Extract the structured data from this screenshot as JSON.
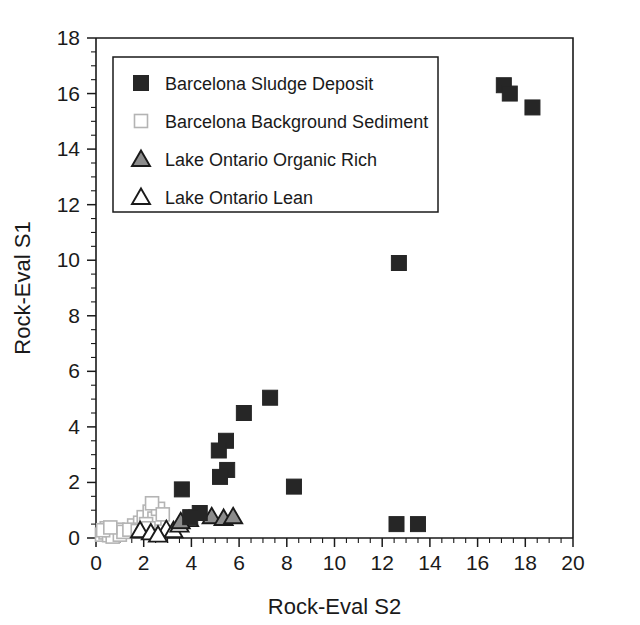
{
  "figure": {
    "background": "#ffffff"
  },
  "chart_data": {
    "type": "scatter",
    "title": "",
    "xlabel": "Rock-Eval S2",
    "ylabel": "Rock-Eval S1",
    "xlim": [
      0,
      20
    ],
    "ylim": [
      0,
      18
    ],
    "xticks": [
      0,
      2,
      4,
      6,
      8,
      10,
      12,
      14,
      16,
      18,
      20
    ],
    "yticks": [
      0,
      2,
      4,
      6,
      8,
      10,
      12,
      14,
      16,
      18
    ],
    "xtick_labels": [
      "0",
      "2",
      "4",
      "6",
      "8",
      "10",
      "12",
      "14",
      "16",
      "18",
      "20"
    ],
    "ytick_labels": [
      "0",
      "2",
      "4",
      "6",
      "8",
      "10",
      "12",
      "14",
      "16",
      "18"
    ],
    "x_minor_step": 0.5,
    "y_minor_step": 0.5,
    "grid": false,
    "legend_position": "upper-left-inside",
    "series": [
      {
        "name": "Barcelona Sludge Deposit",
        "marker": "filled-square",
        "color": "#262626",
        "edge_color": "#262626",
        "size": 15,
        "points": [
          [
            17.1,
            16.3
          ],
          [
            17.35,
            16.0
          ],
          [
            18.3,
            15.5
          ],
          [
            12.7,
            9.9
          ],
          [
            7.3,
            5.05
          ],
          [
            6.2,
            4.5
          ],
          [
            5.45,
            3.5
          ],
          [
            5.15,
            3.15
          ],
          [
            5.5,
            2.45
          ],
          [
            5.2,
            2.2
          ],
          [
            8.3,
            1.85
          ],
          [
            3.6,
            1.75
          ],
          [
            12.6,
            0.5
          ],
          [
            13.5,
            0.5
          ],
          [
            4.35,
            0.9
          ],
          [
            3.95,
            0.75
          ]
        ]
      },
      {
        "name": "Barcelona Background Sediment",
        "marker": "open-square",
        "color": "#ffffff",
        "edge_color": "#b4b4b4",
        "size": 13,
        "points": [
          [
            0.25,
            0.12
          ],
          [
            0.4,
            0.2
          ],
          [
            0.55,
            0.1
          ],
          [
            0.65,
            0.28
          ],
          [
            0.8,
            0.15
          ],
          [
            0.9,
            0.3
          ],
          [
            0.45,
            0.35
          ],
          [
            0.7,
            0.05
          ],
          [
            1.0,
            0.12
          ],
          [
            1.15,
            0.22
          ],
          [
            0.3,
            0.28
          ],
          [
            0.6,
            0.38
          ],
          [
            1.6,
            0.45
          ],
          [
            1.85,
            0.55
          ],
          [
            2.0,
            0.75
          ],
          [
            2.25,
            0.95
          ],
          [
            2.45,
            0.7
          ],
          [
            2.1,
            0.5
          ],
          [
            2.6,
            1.05
          ],
          [
            2.35,
            1.25
          ],
          [
            1.4,
            0.3
          ],
          [
            1.75,
            0.25
          ],
          [
            2.8,
            0.85
          ],
          [
            2.2,
            0.35
          ]
        ]
      },
      {
        "name": "Lake Ontario Organic Rich",
        "marker": "filled-triangle",
        "color": "#8c8c8c",
        "edge_color": "#1a1a1a",
        "size": 17,
        "points": [
          [
            4.85,
            0.78
          ],
          [
            5.35,
            0.72
          ],
          [
            5.75,
            0.78
          ],
          [
            3.9,
            0.68
          ],
          [
            3.55,
            0.6
          ]
        ]
      },
      {
        "name": "Lake Ontario Lean",
        "marker": "open-triangle",
        "color": "#ffffff",
        "edge_color": "#1a1a1a",
        "size": 17,
        "points": [
          [
            1.85,
            0.28
          ],
          [
            2.3,
            0.2
          ],
          [
            2.95,
            0.32
          ],
          [
            3.25,
            0.28
          ],
          [
            2.6,
            0.12
          ],
          [
            3.5,
            0.48
          ]
        ]
      }
    ]
  },
  "legend": {
    "items": [
      {
        "label": "Barcelona Sludge Deposit",
        "marker": "filled-square"
      },
      {
        "label": "Barcelona Background Sediment",
        "marker": "open-square"
      },
      {
        "label": "Lake Ontario Organic Rich",
        "marker": "filled-triangle"
      },
      {
        "label": "Lake Ontario Lean",
        "marker": "open-triangle"
      }
    ]
  },
  "colors": {
    "axis": "#1a1a1a",
    "sludge": "#262626",
    "background_sediment_edge": "#b4b4b4",
    "organic_rich_fill": "#8c8c8c",
    "lean_edge": "#1a1a1a"
  }
}
